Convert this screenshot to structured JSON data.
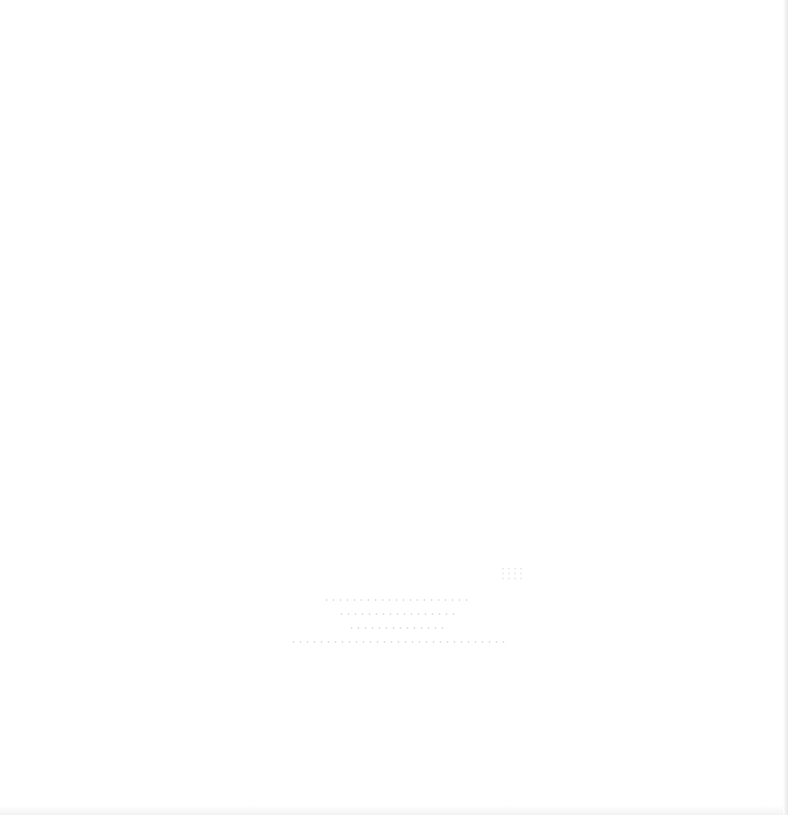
{
  "page": {
    "background_color": "#ffffff",
    "edge_color": "#e8e8e8"
  },
  "faded_text_block": {
    "line_count": 4,
    "legible": false
  }
}
